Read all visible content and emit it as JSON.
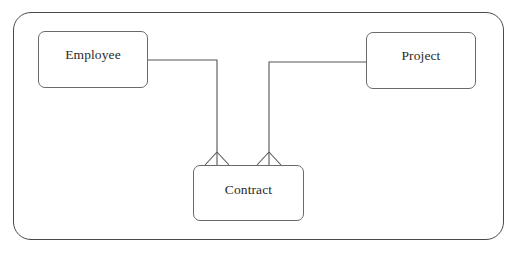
{
  "diagram": {
    "type": "entity-relationship",
    "notation": "crow's foot",
    "entities": [
      {
        "id": "employee",
        "label": "Employee"
      },
      {
        "id": "project",
        "label": "Project"
      },
      {
        "id": "contract",
        "label": "Contract"
      }
    ],
    "relationships": [
      {
        "from": "employee",
        "to": "contract",
        "cardinality_at_contract": "many"
      },
      {
        "from": "project",
        "to": "contract",
        "cardinality_at_contract": "many"
      }
    ],
    "colors": {
      "frame": "#4a4a4a",
      "entity_border": "#6a6a6a",
      "line": "#555555",
      "text": "#2a2a2a",
      "background": "#ffffff"
    }
  }
}
